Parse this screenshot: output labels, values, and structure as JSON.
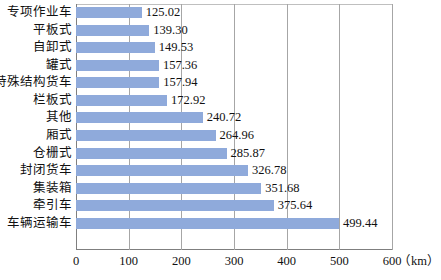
{
  "chart_data": {
    "type": "bar",
    "orientation": "horizontal",
    "title": "",
    "subtitle": "",
    "xlabel": "（km）",
    "ylabel": "",
    "unit": "（km）",
    "xlim": [
      0,
      600
    ],
    "xticks": [
      0,
      100,
      200,
      300,
      400,
      500,
      600
    ],
    "xtick_labels": [
      "0",
      "100",
      "200",
      "300",
      "400",
      "500",
      "600"
    ],
    "grid": true,
    "grid_axis": "x",
    "legend": false,
    "legend_position": "none",
    "bar_color": "#8faadb",
    "categories": [
      "专项作业车",
      "平板式",
      "自卸式",
      "罐式",
      "特殊结构货车",
      "栏板式",
      "其他",
      "厢式",
      "仓栅式",
      "封闭货车",
      "集装箱",
      "牵引车",
      "车辆运输车"
    ],
    "values": [
      125.02,
      139.3,
      149.53,
      157.36,
      157.94,
      172.92,
      240.72,
      264.96,
      285.87,
      326.78,
      351.68,
      375.64,
      499.44
    ],
    "data_labels": [
      "125.02",
      "139.30",
      "149.53",
      "157.36",
      "157.94",
      "172.92",
      "240.72",
      "264.96",
      "285.87",
      "326.78",
      "351.68",
      "375.64",
      "499.44"
    ]
  }
}
